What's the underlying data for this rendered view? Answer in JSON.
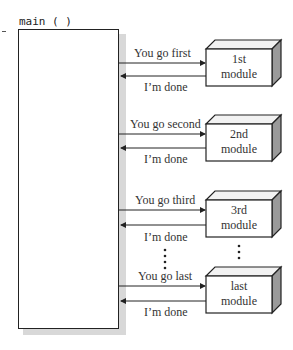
{
  "main": {
    "label": "main ( )"
  },
  "modules": [
    {
      "line1": "1st",
      "line2": "module",
      "call_label": "You go first",
      "return_label": "I’m done"
    },
    {
      "line1": "2nd",
      "line2": "module",
      "call_label": "You go second",
      "return_label": "I’m done"
    },
    {
      "line1": "3rd",
      "line2": "module",
      "call_label": "You go third",
      "return_label": "I’m done"
    },
    {
      "line1": "last",
      "line2": "module",
      "call_label": "You go last",
      "return_label": "I’m done"
    }
  ],
  "ellipsis": "⋮",
  "colors": {
    "line": "#222222",
    "shadow": "#d8d8d8",
    "box_top": "#f2f2f2",
    "box_side": "#9a9a9a"
  }
}
